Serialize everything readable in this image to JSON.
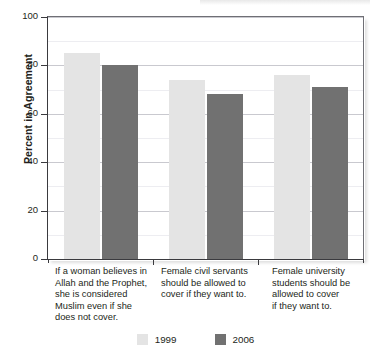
{
  "chart_data": {
    "type": "bar",
    "title": "",
    "xlabel": "",
    "ylabel": "Percent in Agreement",
    "ylim": [
      0,
      100
    ],
    "yticks": [
      0,
      20,
      40,
      60,
      80,
      100
    ],
    "ytick_labels": [
      "0",
      "20",
      "40",
      "60",
      "80",
      "100"
    ],
    "minor_tick_step": 10,
    "grid": "horizontal",
    "legend_position": "bottom-center",
    "categories": [
      "If a woman believes in Allah and the Prophet, she is considered Muslim even if she does not cover.",
      "Female civil servants should be allowed to cover if they want to.",
      "Female university students should be allowed to cover if they want to."
    ],
    "category_lines": [
      [
        "If a woman believes in",
        "Allah and the Prophet,",
        "she is considered",
        "Muslim even if she",
        "does not cover."
      ],
      [
        "Female civil servants",
        "should be allowed to",
        "cover if they want to."
      ],
      [
        "Female university",
        "students should be",
        "allowed to cover",
        "if they want to."
      ]
    ],
    "series": [
      {
        "name": "1999",
        "color": "#e4e4e4",
        "values": [
          85,
          74,
          76
        ]
      },
      {
        "name": "2006",
        "color": "#717171",
        "values": [
          80,
          68,
          71
        ]
      }
    ]
  },
  "legend": {
    "items": [
      {
        "label": "1999",
        "color": "#e4e4e4"
      },
      {
        "label": "2006",
        "color": "#717171"
      }
    ]
  },
  "axis": {
    "y_title": "Percent in Agreement"
  }
}
